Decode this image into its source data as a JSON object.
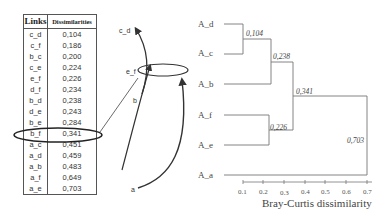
{
  "table": {
    "headers": [
      "Links",
      "Dissimilarities"
    ],
    "rows": [
      {
        "link": "c_d",
        "value": "0,104"
      },
      {
        "link": "c_f",
        "value": "0,186"
      },
      {
        "link": "b_c",
        "value": "0,200"
      },
      {
        "link": "c_e",
        "value": "0,224"
      },
      {
        "link": "e_f",
        "value": "0,226"
      },
      {
        "link": "d_f",
        "value": "0,234"
      },
      {
        "link": "b_d",
        "value": "0,238"
      },
      {
        "link": "d_e",
        "value": "0,243"
      },
      {
        "link": "b_e",
        "value": "0,284"
      },
      {
        "link": "b_f",
        "value": "0,341"
      },
      {
        "link": "a_c",
        "value": "0,451"
      },
      {
        "link": "a_d",
        "value": "0,459"
      },
      {
        "link": "a_b",
        "value": "0,483"
      },
      {
        "link": "a_f",
        "value": "0,649"
      },
      {
        "link": "a_e",
        "value": "0,703"
      }
    ],
    "highlighted_row": "b_f"
  },
  "sketch": {
    "labels": {
      "cd": "c_d",
      "ef": "e_f",
      "b": "b",
      "a": "a"
    }
  },
  "dendrogram": {
    "leaves": [
      "A_d",
      "A_c",
      "A_b",
      "A_f",
      "A_e",
      "A_a"
    ],
    "merges": [
      {
        "height": "0,104",
        "joins": [
          "A_d",
          "A_c"
        ]
      },
      {
        "height": "0,238",
        "joins": [
          "A_d+A_c",
          "A_b"
        ]
      },
      {
        "height": "0,226",
        "joins": [
          "A_f",
          "A_e"
        ]
      },
      {
        "height": "0,341",
        "joins": [
          "A_d+A_c+A_b",
          "A_f+A_e"
        ]
      },
      {
        "height": "0,703",
        "joins": [
          "A_d+A_c+A_b+A_f+A_e",
          "A_a"
        ]
      }
    ],
    "axis": {
      "ticks": [
        "0.1",
        "0.2",
        "0.3",
        "0.4",
        "0.5",
        "0.6",
        "0.7"
      ],
      "label": "Bray-Curtis dissimilarity"
    }
  }
}
